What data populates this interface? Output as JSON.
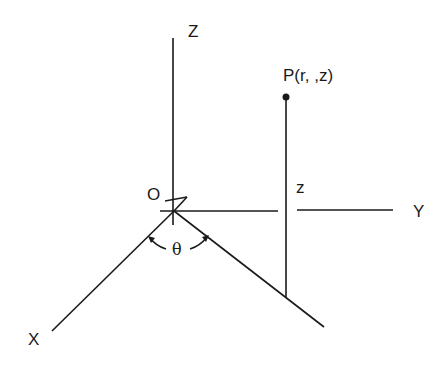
{
  "diagram": {
    "labels": {
      "z_axis": "Z",
      "y_axis": "Y",
      "x_axis": "X",
      "origin": "O",
      "point": "P(r, ,z)",
      "height": "z",
      "angle": "θ"
    },
    "colors": {
      "line": "#1a1a1a",
      "background": "#ffffff"
    }
  }
}
